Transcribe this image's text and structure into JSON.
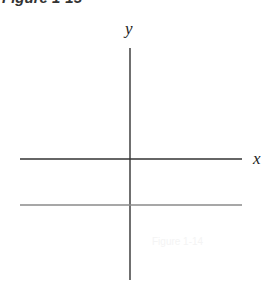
{
  "figure": {
    "title": "Figure 1-15",
    "ghost_text": "Figure 1-14"
  },
  "axes": {
    "x_label": "x",
    "y_label": "y",
    "x_axis": {
      "y_px": 159,
      "x_start": 20,
      "x_end": 242,
      "color": "#333333"
    },
    "y_axis": {
      "x_px": 130,
      "y_start": 48,
      "y_end": 280,
      "color": "#333333"
    }
  },
  "lines": [
    {
      "name": "horizontal-line",
      "y_px": 205,
      "x_start": 20,
      "x_end": 242,
      "color": "#8a8a8a",
      "description": "horizontal line below x-axis (y = negative constant)"
    }
  ]
}
